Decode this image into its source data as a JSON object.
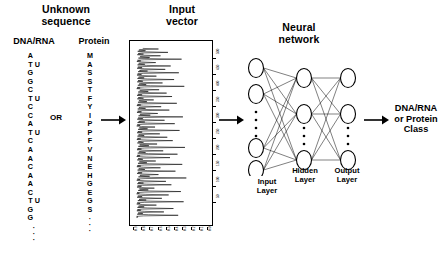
{
  "diagram": {
    "title_left": "Unknown\nsequence",
    "sections": {
      "unknown_sequence": {
        "heading_line1": "Unknown",
        "heading_line2": "sequence",
        "dna_header": "DNA/RNA",
        "protein_header": "Protein",
        "or_label": "OR",
        "dna_sequence": [
          {
            "base": "A",
            "alt": ""
          },
          {
            "base": "T",
            "alt": "U"
          },
          {
            "base": "G",
            "alt": ""
          },
          {
            "base": "G",
            "alt": ""
          },
          {
            "base": "C",
            "alt": ""
          },
          {
            "base": "T",
            "alt": "U"
          },
          {
            "base": "C",
            "alt": ""
          },
          {
            "base": "C",
            "alt": ""
          },
          {
            "base": "A",
            "alt": ""
          },
          {
            "base": "T",
            "alt": "U"
          },
          {
            "base": "C",
            "alt": ""
          },
          {
            "base": "A",
            "alt": ""
          },
          {
            "base": "A",
            "alt": ""
          },
          {
            "base": "C",
            "alt": ""
          },
          {
            "base": "A",
            "alt": ""
          },
          {
            "base": "A",
            "alt": ""
          },
          {
            "base": "C",
            "alt": ""
          },
          {
            "base": "T",
            "alt": "U"
          },
          {
            "base": "G",
            "alt": ""
          },
          {
            "base": "G",
            "alt": ""
          }
        ],
        "dna_continuation": "·\n·\n·",
        "protein_sequence": [
          "M",
          "A",
          "S",
          "S",
          "T",
          "F",
          "Y",
          "I",
          "P",
          "P",
          "F",
          "V",
          "N",
          "E",
          "H",
          "G",
          "E",
          "G",
          "S"
        ],
        "protein_continuation": "·\n·\n·"
      },
      "input_vector": {
        "heading_line1": "Input",
        "heading_line2": "vector",
        "y_tick_labels": [
          "500",
          "450",
          "400",
          "350",
          "300",
          "250",
          "200",
          "150",
          "100",
          "50"
        ],
        "x_tick_labels": [
          "0.9",
          "0.8",
          "0.7",
          "0.6",
          "0.5",
          "0.4",
          "0.3",
          "0.2",
          "0.1",
          "0.0"
        ]
      },
      "neural_network": {
        "heading_line1": "Neural",
        "heading_line2": "network",
        "input_layer_label_line1": "Input",
        "input_layer_label_line2": "Layer",
        "hidden_layer_label_line1": "Hidden",
        "hidden_layer_label_line2": "Layer",
        "output_layer_label_line1": "Output",
        "output_layer_label_line2": "Layer"
      },
      "output": {
        "line1": "DNA/RNA",
        "line2": "or Protein",
        "line3": "Class"
      }
    },
    "colors": {
      "ink": "#000000",
      "background": "#ffffff"
    }
  },
  "chart_data": {
    "type": "line",
    "title": "Input vector",
    "orientation": "vertical-trace",
    "xlabel": "",
    "ylabel": "",
    "ylim": [
      0,
      520
    ],
    "xlim": [
      0.0,
      1.0
    ],
    "grid": false,
    "legend": null,
    "y_ticks": [
      50,
      100,
      150,
      200,
      250,
      300,
      350,
      400,
      450,
      500
    ],
    "x_ticks": [
      0.0,
      0.1,
      0.2,
      0.3,
      0.4,
      0.5,
      0.6,
      0.7,
      0.8,
      0.9
    ],
    "series": [
      {
        "name": "input vector amplitude",
        "values": [
          0.03,
          0.62,
          0.1,
          0.41,
          0.07,
          0.55,
          0.12,
          0.3,
          0.06,
          0.7,
          0.15,
          0.38,
          0.09,
          0.48,
          0.05,
          0.66,
          0.18,
          0.27,
          0.08,
          0.52,
          0.11,
          0.44,
          0.06,
          0.74,
          0.2,
          0.33,
          0.09,
          0.58,
          0.13,
          0.36,
          0.07,
          0.68,
          0.16,
          0.29,
          0.1,
          0.5,
          0.06,
          0.61,
          0.14,
          0.4,
          0.08,
          0.72,
          0.19,
          0.31,
          0.11,
          0.54,
          0.07,
          0.46,
          0.12,
          0.35,
          0.09,
          0.64,
          0.17,
          0.28,
          0.06,
          0.57,
          0.13,
          0.42,
          0.1,
          0.69,
          0.21,
          0.32,
          0.08,
          0.49,
          0.14,
          0.37,
          0.07,
          0.6,
          0.16,
          0.26,
          0.11,
          0.53,
          0.09,
          0.45,
          0.18,
          0.34,
          0.06,
          0.71,
          0.15,
          0.39,
          0.1,
          0.56,
          0.12,
          0.3,
          0.08,
          0.63,
          0.17,
          0.43,
          0.09,
          0.51,
          0.13,
          0.29,
          0.07,
          0.67,
          0.2,
          0.36,
          0.11,
          0.47,
          0.14,
          0.33
        ]
      }
    ]
  }
}
